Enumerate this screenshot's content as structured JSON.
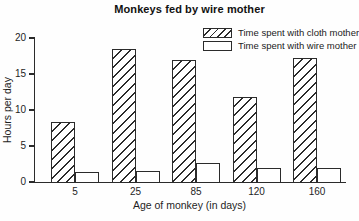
{
  "title": "Monkeys fed by wire mother",
  "colors": {
    "line": "#2b2b2b",
    "background": "#ffffff",
    "bar_fill": "#ffffff"
  },
  "chart_data": {
    "type": "bar",
    "title": "Monkeys fed by wire mother",
    "categories": [
      "5",
      "25",
      "85",
      "120",
      "160"
    ],
    "series": [
      {
        "name": "Time spent with cloth mother",
        "values": [
          8.4,
          18.5,
          17.0,
          11.8,
          17.2
        ],
        "fill": "hatched"
      },
      {
        "name": "Time spent with wire mother",
        "values": [
          1.4,
          1.5,
          2.6,
          2.0,
          2.0
        ],
        "fill": "white"
      }
    ],
    "xlabel": "Age of monkey (in days)",
    "ylabel": "Hours per day",
    "ylim": [
      0,
      20
    ],
    "yticks": [
      0,
      5,
      10,
      15,
      20
    ],
    "legend_position": "top-right",
    "grid": false
  }
}
